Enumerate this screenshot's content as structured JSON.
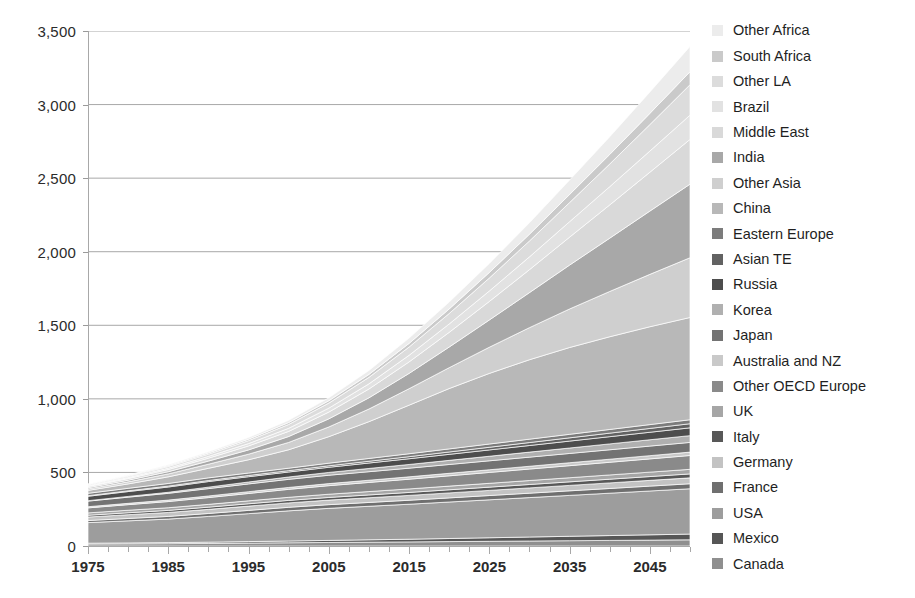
{
  "chart_data": {
    "type": "area",
    "stacked": true,
    "title": "",
    "subtitle": "",
    "xlabel": "",
    "ylabel": "",
    "xlim": [
      1975,
      2050
    ],
    "ylim": [
      0,
      3500
    ],
    "ytick_labels": [
      "0",
      "500",
      "1,000",
      "1,500",
      "2,000",
      "2,500",
      "3,000",
      "3,500"
    ],
    "ytick_values": [
      0,
      500,
      1000,
      1500,
      2000,
      2500,
      3000,
      3500
    ],
    "xtick_labels": [
      "1975",
      "1985",
      "1995",
      "2005",
      "2015",
      "2025",
      "2035",
      "2045"
    ],
    "xtick_values": [
      1975,
      1985,
      1995,
      2005,
      2015,
      2025,
      2035,
      2045
    ],
    "xtick_minor_values": [
      1980,
      1990,
      2000,
      2010,
      2020,
      2030,
      2040,
      2050
    ],
    "grid": "horizontal",
    "legend_position": "right",
    "x": [
      1975,
      1980,
      1985,
      1990,
      1995,
      2000,
      2005,
      2010,
      2015,
      2020,
      2025,
      2030,
      2035,
      2040,
      2045,
      2050
    ],
    "series": [
      {
        "name": "Canada",
        "color": "#8f8f8f",
        "values": [
          14,
          15,
          16,
          18,
          20,
          22,
          24,
          26,
          28,
          30,
          32,
          34,
          36,
          38,
          40,
          42
        ]
      },
      {
        "name": "Mexico",
        "color": "#565656",
        "values": [
          5,
          6,
          7,
          8,
          10,
          12,
          14,
          16,
          18,
          21,
          24,
          27,
          30,
          33,
          36,
          39
        ]
      },
      {
        "name": "USA",
        "color": "#9d9d9d",
        "values": [
          140,
          150,
          160,
          175,
          190,
          205,
          218,
          228,
          238,
          248,
          258,
          268,
          278,
          288,
          298,
          308
        ]
      },
      {
        "name": "France",
        "color": "#6f6f6f",
        "values": [
          14,
          16,
          18,
          20,
          22,
          24,
          25,
          26,
          27,
          28,
          29,
          30,
          31,
          32,
          33,
          34
        ]
      },
      {
        "name": "Germany",
        "color": "#c3c3c3",
        "values": [
          24,
          26,
          27,
          28,
          29,
          30,
          31,
          32,
          33,
          34,
          35,
          36,
          37,
          38,
          39,
          40
        ]
      },
      {
        "name": "Italy",
        "color": "#585858",
        "values": [
          12,
          13,
          14,
          15,
          16,
          17,
          18,
          19,
          20,
          21,
          22,
          23,
          24,
          25,
          26,
          27
        ]
      },
      {
        "name": "UK",
        "color": "#a6a6a6",
        "values": [
          16,
          17,
          18,
          19,
          20,
          21,
          22,
          23,
          24,
          25,
          26,
          27,
          28,
          29,
          30,
          31
        ]
      },
      {
        "name": "Other OECD Europe",
        "color": "#8a8a8a",
        "values": [
          34,
          38,
          42,
          46,
          50,
          54,
          58,
          62,
          66,
          70,
          74,
          78,
          82,
          86,
          90,
          94
        ]
      },
      {
        "name": "Australia and NZ",
        "color": "#c9c9c9",
        "values": [
          8,
          9,
          10,
          11,
          12,
          13,
          14,
          15,
          16,
          17,
          18,
          19,
          20,
          21,
          22,
          23
        ]
      },
      {
        "name": "Japan",
        "color": "#737373",
        "values": [
          38,
          42,
          46,
          50,
          53,
          55,
          57,
          58,
          59,
          60,
          61,
          62,
          63,
          64,
          65,
          66
        ]
      },
      {
        "name": "Korea",
        "color": "#b0b0b0",
        "values": [
          3,
          5,
          7,
          10,
          13,
          16,
          19,
          22,
          25,
          28,
          31,
          34,
          37,
          40,
          43,
          46
        ]
      },
      {
        "name": "Russia",
        "color": "#4d4d4d",
        "values": [
          30,
          33,
          36,
          38,
          36,
          34,
          35,
          37,
          39,
          41,
          43,
          45,
          47,
          49,
          51,
          53
        ]
      },
      {
        "name": "Asian TE",
        "color": "#626262",
        "values": [
          4,
          5,
          6,
          7,
          8,
          9,
          10,
          12,
          14,
          16,
          18,
          20,
          22,
          24,
          26,
          28
        ]
      },
      {
        "name": "Eastern Europe",
        "color": "#7c7c7c",
        "values": [
          16,
          17,
          18,
          18,
          17,
          17,
          18,
          19,
          20,
          21,
          22,
          23,
          24,
          25,
          26,
          27
        ]
      },
      {
        "name": "China",
        "color": "#b8b8b8",
        "values": [
          20,
          30,
          45,
          65,
          90,
          125,
          180,
          250,
          330,
          410,
          480,
          540,
          590,
          630,
          665,
          695
        ]
      },
      {
        "name": "Other Asia",
        "color": "#cfcfcf",
        "values": [
          10,
          14,
          20,
          28,
          38,
          50,
          66,
          86,
          112,
          142,
          178,
          218,
          262,
          308,
          356,
          406
        ]
      },
      {
        "name": "India",
        "color": "#a8a8a8",
        "values": [
          8,
          11,
          15,
          21,
          29,
          40,
          55,
          76,
          104,
          140,
          185,
          238,
          298,
          362,
          430,
          500
        ]
      },
      {
        "name": "Middle East",
        "color": "#d9d9d9",
        "values": [
          8,
          11,
          15,
          20,
          27,
          35,
          46,
          60,
          78,
          100,
          126,
          156,
          190,
          226,
          264,
          304
        ]
      },
      {
        "name": "Brazil",
        "color": "#e2e2e2",
        "values": [
          5,
          7,
          9,
          12,
          16,
          21,
          27,
          35,
          45,
          57,
          71,
          87,
          105,
          124,
          144,
          165
        ]
      },
      {
        "name": "Other LA",
        "color": "#dcdcdc",
        "values": [
          6,
          8,
          11,
          15,
          20,
          26,
          34,
          44,
          56,
          71,
          88,
          108,
          130,
          154,
          180,
          207
        ]
      },
      {
        "name": "South Africa",
        "color": "#cacaca",
        "values": [
          4,
          5,
          6,
          8,
          10,
          13,
          16,
          20,
          25,
          31,
          38,
          46,
          55,
          65,
          76,
          88
        ]
      },
      {
        "name": "Other Africa",
        "color": "#ececec",
        "values": [
          3,
          4,
          6,
          8,
          11,
          15,
          20,
          27,
          36,
          47,
          61,
          78,
          98,
          120,
          145,
          172
        ]
      }
    ]
  },
  "legend": {
    "items": [
      {
        "label": "Other Africa",
        "color": "#ececec"
      },
      {
        "label": "South Africa",
        "color": "#cacaca"
      },
      {
        "label": "Other LA",
        "color": "#dcdcdc"
      },
      {
        "label": "Brazil",
        "color": "#e2e2e2"
      },
      {
        "label": "Middle East",
        "color": "#d9d9d9"
      },
      {
        "label": "India",
        "color": "#a8a8a8"
      },
      {
        "label": "Other Asia",
        "color": "#cfcfcf"
      },
      {
        "label": "China",
        "color": "#b8b8b8"
      },
      {
        "label": "Eastern Europe",
        "color": "#7c7c7c"
      },
      {
        "label": "Asian TE",
        "color": "#626262"
      },
      {
        "label": "Russia",
        "color": "#4d4d4d"
      },
      {
        "label": "Korea",
        "color": "#b0b0b0"
      },
      {
        "label": "Japan",
        "color": "#737373"
      },
      {
        "label": "Australia and NZ",
        "color": "#c9c9c9"
      },
      {
        "label": "Other OECD Europe",
        "color": "#8a8a8a"
      },
      {
        "label": "UK",
        "color": "#a6a6a6"
      },
      {
        "label": "Italy",
        "color": "#585858"
      },
      {
        "label": "Germany",
        "color": "#c3c3c3"
      },
      {
        "label": "France",
        "color": "#6f6f6f"
      },
      {
        "label": "USA",
        "color": "#9d9d9d"
      },
      {
        "label": "Mexico",
        "color": "#565656"
      },
      {
        "label": "Canada",
        "color": "#8f8f8f"
      }
    ]
  }
}
